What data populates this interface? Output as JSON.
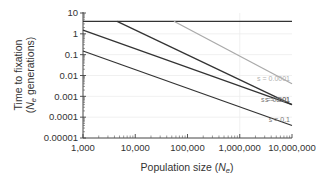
{
  "chart_data": {
    "type": "line",
    "title": "",
    "xlabel": "Population size (Ne)",
    "xlabel_parts": {
      "main": "Population size (",
      "var": "N",
      "sub": "e",
      "end": ")"
    },
    "ylabel_line1": "Time to fixation",
    "ylabel_line2_parts": {
      "open": "(",
      "var": "N",
      "sub": "e",
      "rest": " generations)"
    },
    "ylabel": "Time to fixation (Ne generations)",
    "x_scale": "log",
    "y_scale": "log",
    "xlim": [
      1000,
      10000000
    ],
    "ylim": [
      1e-05,
      10
    ],
    "x_ticks": [
      1000,
      10000,
      100000,
      1000000,
      10000000
    ],
    "x_tick_labels": [
      "1,000",
      "10,000",
      "100,000",
      "1,000,000",
      "10,000,000"
    ],
    "y_ticks": [
      10,
      1,
      0.1,
      0.01,
      0.001,
      0.0001,
      1e-05
    ],
    "y_tick_labels": [
      "10",
      "1",
      "0.1",
      "0.01",
      "0.001",
      "0.0001",
      "0.00001"
    ],
    "grid": {
      "horizontal": "each decade (faint)",
      "vertical": "at 1,000,000 (faint)"
    },
    "legend": "inline labels at right end of each line",
    "series": [
      {
        "name": "neutral",
        "label": "",
        "color": "#333333",
        "points": [
          [
            1000,
            4
          ],
          [
            10000000,
            4
          ]
        ]
      },
      {
        "name": "s = 0.0001",
        "label": "s = 0.0001",
        "color": "#aaaaaa",
        "label_color": "#b0b0b0",
        "points": [
          [
            55000,
            4
          ],
          [
            10000000,
            0.004
          ]
        ]
      },
      {
        "name": "s = 0.001",
        "label": "s = 0.001",
        "color": "#333333",
        "label_color": "#777777",
        "points": [
          [
            4500,
            4
          ],
          [
            10000000,
            0.0004
          ]
        ]
      },
      {
        "name": "s = 0.01",
        "label": "s = 0.01",
        "color": "#333333",
        "label_color": "#777777",
        "points": [
          [
            1000,
            1.5
          ],
          [
            10000000,
            0.0004
          ]
        ]
      },
      {
        "name": "s = 0.1",
        "label": "s = 0.1",
        "color": "#333333",
        "label_color": "#777777",
        "points": [
          [
            1000,
            0.15
          ],
          [
            10000000,
            4e-05
          ]
        ]
      }
    ]
  }
}
